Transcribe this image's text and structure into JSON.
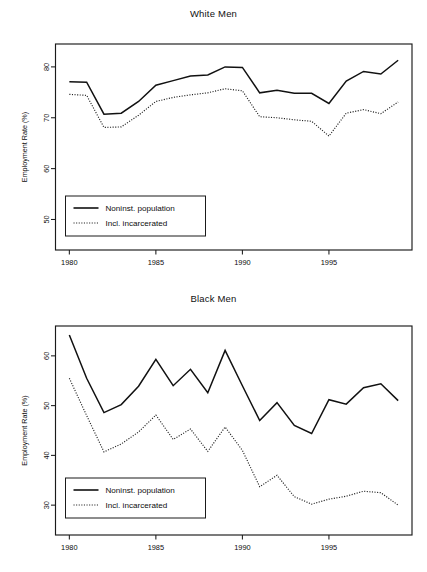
{
  "figure": {
    "panel_count": 2,
    "background_color": "#ffffff",
    "line_color": "#111111"
  },
  "chart_data": [
    {
      "type": "line",
      "title": "White Men",
      "xlabel": "",
      "ylabel": "Employment Rate (%)",
      "xlim": [
        1979.2,
        1999.8
      ],
      "ylim": [
        44.0,
        84.5
      ],
      "xticks": [
        1980,
        1985,
        1990,
        1995
      ],
      "xtick_labels": [
        "1980",
        "1985",
        "1990",
        "1995"
      ],
      "yticks": [
        50,
        60,
        70,
        80
      ],
      "ytick_labels": [
        "50",
        "60",
        "70",
        "80"
      ],
      "grid": false,
      "legend_position": "lower left",
      "x": [
        1980,
        1981,
        1982,
        1983,
        1984,
        1985,
        1986,
        1987,
        1988,
        1989,
        1990,
        1991,
        1992,
        1993,
        1994,
        1995,
        1996,
        1997,
        1998,
        1999
      ],
      "series": [
        {
          "name": "Noninst. population",
          "style": "solid",
          "values": [
            77.1,
            77.0,
            70.7,
            70.9,
            73.2,
            76.4,
            77.3,
            78.2,
            78.4,
            80.0,
            79.9,
            74.9,
            75.4,
            74.8,
            74.8,
            72.8,
            77.2,
            79.1,
            78.6,
            81.3
          ]
        },
        {
          "name": "Incl. incarcerated",
          "style": "dotted",
          "values": [
            74.6,
            74.4,
            68.1,
            68.2,
            70.5,
            73.2,
            74.0,
            74.5,
            74.9,
            75.7,
            75.3,
            70.2,
            70.0,
            69.6,
            69.3,
            66.4,
            70.9,
            71.6,
            70.8,
            73.1
          ]
        }
      ]
    },
    {
      "type": "line",
      "title": "Black Men",
      "xlabel": "",
      "ylabel": "Employment Rate (%)",
      "xlim": [
        1979.2,
        1999.8
      ],
      "ylim": [
        24.0,
        66.0
      ],
      "xticks": [
        1980,
        1985,
        1990,
        1995
      ],
      "xtick_labels": [
        "1980",
        "1985",
        "1990",
        "1995"
      ],
      "yticks": [
        30,
        40,
        50,
        60
      ],
      "ytick_labels": [
        "30",
        "40",
        "50",
        "60"
      ],
      "grid": false,
      "legend_position": "lower left",
      "x": [
        1980,
        1981,
        1982,
        1983,
        1984,
        1985,
        1986,
        1987,
        1988,
        1989,
        1990,
        1991,
        1992,
        1993,
        1994,
        1995,
        1996,
        1997,
        1998,
        1999
      ],
      "series": [
        {
          "name": "Noninst. population",
          "style": "solid",
          "values": [
            64.2,
            55.5,
            48.6,
            50.2,
            53.9,
            59.3,
            54.0,
            57.3,
            52.6,
            61.1,
            54.0,
            47.0,
            50.6,
            46.0,
            44.4,
            51.2,
            50.3,
            53.6,
            54.4,
            51.0
          ]
        },
        {
          "name": "Incl. incarcerated",
          "style": "dotted",
          "values": [
            55.5,
            48.0,
            40.7,
            42.3,
            44.7,
            48.1,
            43.2,
            45.3,
            40.8,
            45.7,
            41.0,
            33.7,
            36.0,
            31.7,
            30.2,
            31.2,
            31.8,
            32.8,
            32.5,
            30.0
          ]
        }
      ]
    }
  ],
  "legend": {
    "entries": [
      {
        "label": "Noninst. population",
        "style": "solid"
      },
      {
        "label": "Incl. incarcerated",
        "style": "dotted"
      }
    ]
  }
}
